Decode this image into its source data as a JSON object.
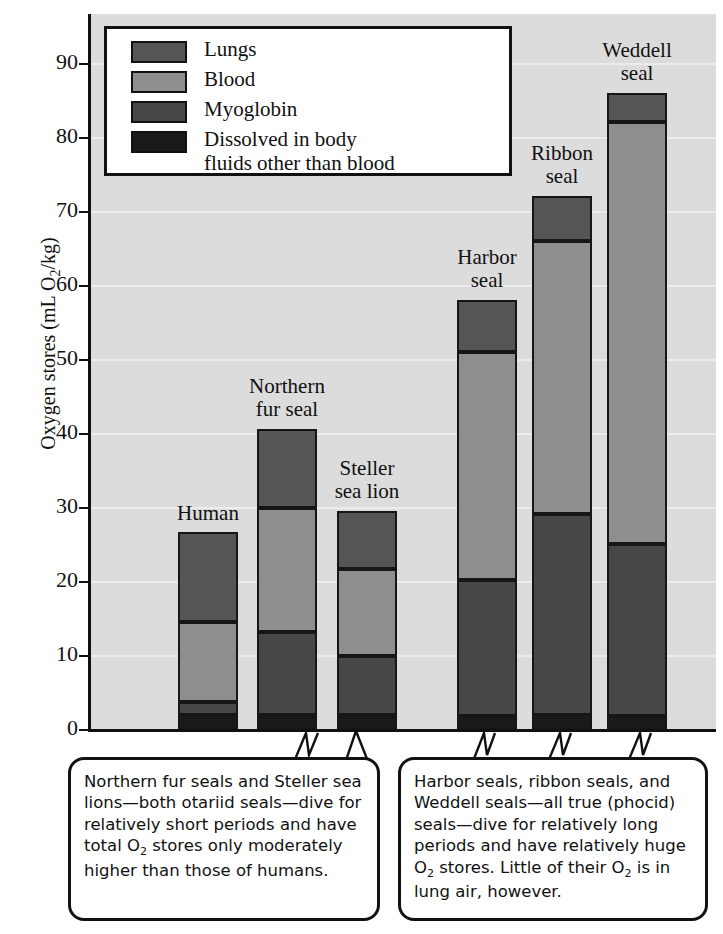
{
  "chart_data": {
    "type": "bar",
    "title": "",
    "xlabel": "",
    "ylabel": "Oxygen stores (mL O₂/kg)",
    "ylim": [
      0,
      95
    ],
    "y_ticks": [
      0,
      10,
      20,
      30,
      40,
      50,
      60,
      70,
      80,
      90
    ],
    "grid": true,
    "stacked": true,
    "legend_position": "top-left-inside",
    "categories": [
      "Human",
      "Northern fur seal",
      "Steller sea lion",
      "Harbor seal",
      "Ribbon seal",
      "Weddell seal"
    ],
    "series": [
      {
        "name": "Lungs",
        "values": [
          12.2,
          10.8,
          7.9,
          7.0,
          6.0,
          4.0
        ]
      },
      {
        "name": "Blood",
        "values": [
          10.7,
          16.7,
          11.7,
          30.8,
          37.0,
          57.0
        ]
      },
      {
        "name": "Myoglobin",
        "values": [
          1.8,
          11.2,
          8.0,
          18.4,
          27.1,
          23.2
        ]
      },
      {
        "name": "Dissolved in body fluids other than blood",
        "values": [
          1.9,
          1.9,
          1.9,
          1.8,
          1.9,
          1.8
        ]
      }
    ],
    "totals": [
      26.6,
      40.6,
      29.5,
      58.0,
      72.0,
      86.0
    ],
    "annotations": [
      "Northern fur seals and Steller sea lions—both otariid seals—dive for relatively short periods and have total O₂ stores only moderately higher than those of humans.",
      "Harbor seals, ribbon seals, and Weddell seals—all true (phocid) seals—dive for relatively long periods and have relatively huge O₂ stores.  Little of their O₂ is in lung air, however."
    ]
  },
  "axis": {
    "y_title_main": "Oxygen stores (mL O",
    "y_title_sub": "2",
    "y_title_tail": "/kg)",
    "ticks": [
      "90",
      "80",
      "70",
      "60",
      "50",
      "40",
      "30",
      "20",
      "10",
      "0"
    ]
  },
  "legend": {
    "items": [
      {
        "label": "Lungs",
        "color": "#555555"
      },
      {
        "label": "Blood",
        "color": "#8e8e8e"
      },
      {
        "label": "Myoglobin",
        "color": "#474747"
      },
      {
        "label": "Dissolved in body\nfluids other than blood",
        "color": "#1a1a1a"
      }
    ]
  },
  "bars": [
    {
      "name": "Human",
      "label": "Human"
    },
    {
      "name": "Northern fur seal",
      "label": "Northern\nfur seal"
    },
    {
      "name": "Steller sea lion",
      "label": "Steller\nsea lion"
    },
    {
      "name": "Harbor seal",
      "label": "Harbor\nseal"
    },
    {
      "name": "Ribbon seal",
      "label": "Ribbon\nseal"
    },
    {
      "name": "Weddell seal",
      "label": "Weddell\nseal"
    }
  ],
  "callouts": {
    "left_line1": "Northern fur seals and Steller sea",
    "left_line2": "lions—both otariid seals—dive for",
    "left_line3": "relatively short periods and have",
    "left_line4a": "total O",
    "left_line4b": "2",
    "left_line4c": " stores only moderately",
    "left_line5": "higher than those of humans.",
    "right_line1": "Harbor seals, ribbon seals, and",
    "right_line2": "Weddell seals—all true (phocid)",
    "right_line3": "seals—dive for relatively long",
    "right_line4": "periods and have relatively huge",
    "right_line5a": "O",
    "right_line5b": "2",
    "right_line5c": " stores.  Little of their O",
    "right_line5d": "2",
    "right_line5e": " is in",
    "right_line6": "lung air, however."
  },
  "colors": {
    "plot_background": "#dcdcdc",
    "gridline": "#ececec",
    "axis": "#111111",
    "lungs": "#555555",
    "blood": "#8e8e8e",
    "myoglobin": "#474747",
    "dissolved": "#1a1a1a"
  }
}
